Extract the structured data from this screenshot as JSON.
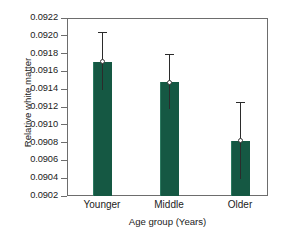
{
  "chart_data": {
    "type": "bar",
    "title": "",
    "xlabel": "Age group (Years)",
    "ylabel": "Relative white matter",
    "categories": [
      "Younger",
      "Middle",
      "Older"
    ],
    "values": [
      0.09171,
      0.09148,
      0.09082
    ],
    "error_low": [
      0.09139,
      0.09118,
      0.09039
    ],
    "error_high": [
      0.09204,
      0.0918,
      0.09126
    ],
    "ylim": [
      0.0902,
      0.0922
    ],
    "ytick_labels": [
      "0.0922",
      "0.0920",
      "0.0918",
      "0.0916",
      "0.0914",
      "0.0912",
      "0.0910",
      "0.0908",
      "0.0906",
      "0.0904",
      "0.0902"
    ],
    "ytick_values": [
      0.0922,
      0.092,
      0.0918,
      0.0916,
      0.0914,
      0.0912,
      0.091,
      0.0908,
      0.0906,
      0.0904,
      0.0902
    ],
    "grid": false,
    "legend": "none",
    "bar_color": "#155843",
    "error_color": "#2b2b2b",
    "axis_color": "#6d6d6d"
  }
}
